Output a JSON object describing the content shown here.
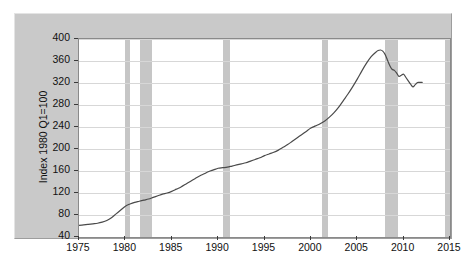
{
  "chart_data": {
    "type": "line",
    "title": "",
    "subtitle": "",
    "xlabel": "",
    "ylabel": "Index 1980 Q1=100",
    "xlim": [
      1975,
      2015
    ],
    "ylim": [
      40,
      400
    ],
    "grid": true,
    "legend": "none",
    "xticks": [
      1975,
      1980,
      1985,
      1990,
      1995,
      2000,
      2005,
      2010,
      2015
    ],
    "yticks": [
      40,
      80,
      120,
      160,
      200,
      240,
      280,
      320,
      360,
      400
    ],
    "series": [
      {
        "name": "Index 1980 Q1=100",
        "color": "#4a4a4a",
        "x": [
          1975.0,
          1975.5,
          1976.0,
          1976.5,
          1977.0,
          1977.5,
          1978.0,
          1978.5,
          1979.0,
          1979.5,
          1980.0,
          1980.5,
          1981.0,
          1981.5,
          1982.0,
          1982.5,
          1983.0,
          1983.5,
          1984.0,
          1984.5,
          1985.0,
          1985.5,
          1986.0,
          1986.5,
          1987.0,
          1987.5,
          1988.0,
          1988.5,
          1989.0,
          1989.5,
          1990.0,
          1990.5,
          1991.0,
          1991.5,
          1992.0,
          1992.5,
          1993.0,
          1993.5,
          1994.0,
          1994.5,
          1995.0,
          1995.5,
          1996.0,
          1996.5,
          1997.0,
          1997.5,
          1998.0,
          1998.5,
          1999.0,
          1999.5,
          2000.0,
          2000.5,
          2001.0,
          2001.5,
          2002.0,
          2002.5,
          2003.0,
          2003.5,
          2004.0,
          2004.5,
          2005.0,
          2005.5,
          2006.0,
          2006.5,
          2007.0,
          2007.25,
          2007.5,
          2007.75,
          2008.0,
          2008.25,
          2008.5,
          2008.75,
          2009.0,
          2009.25,
          2009.5,
          2009.75,
          2010.0,
          2010.25,
          2010.5,
          2010.75,
          2011.0,
          2011.25,
          2011.5,
          2011.75,
          2012.0
        ],
        "y": [
          61,
          62,
          63,
          64,
          65,
          67,
          70,
          75,
          82,
          89,
          96,
          100,
          103,
          105,
          107,
          109,
          112,
          115,
          118,
          120,
          123,
          127,
          131,
          136,
          141,
          146,
          151,
          155,
          159,
          162,
          165,
          166,
          167,
          169,
          171,
          173,
          175,
          178,
          181,
          184,
          188,
          191,
          194,
          198,
          203,
          208,
          214,
          220,
          226,
          232,
          238,
          242,
          246,
          251,
          258,
          266,
          276,
          288,
          300,
          313,
          327,
          342,
          356,
          368,
          376,
          379,
          380,
          378,
          372,
          362,
          352,
          345,
          343,
          338,
          332,
          334,
          336,
          330,
          324,
          318,
          313,
          317,
          321,
          321,
          321
        ]
      }
    ],
    "recession_bands": [
      {
        "start": 1980.0,
        "end": 1980.55,
        "label": "1980 recession"
      },
      {
        "start": 1981.55,
        "end": 1982.9,
        "label": "1981-82 recession"
      },
      {
        "start": 1990.55,
        "end": 1991.25,
        "label": "1990-91 recession"
      },
      {
        "start": 2001.2,
        "end": 2001.9,
        "label": "2001 recession"
      },
      {
        "start": 2007.95,
        "end": 2009.4,
        "label": "2007-09 recession"
      },
      {
        "start": 2014.45,
        "end": 2015.0,
        "label": "right edge shading"
      }
    ],
    "recession_band_color": "#c6c6c6",
    "gridline_color": "#d7d7d7",
    "plot_background": "#ffffff",
    "frame_background": "#c9c9c9"
  }
}
